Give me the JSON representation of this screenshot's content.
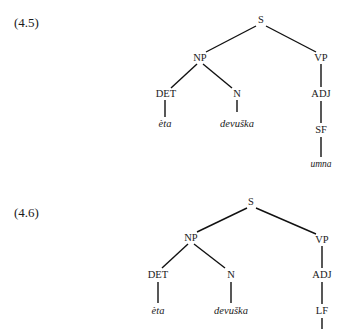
{
  "examples": [
    {
      "number": "(4.5)",
      "nodes": {
        "S": "S",
        "NP": "NP",
        "VP": "VP",
        "DET": "DET",
        "N": "N",
        "ADJ": "ADJ",
        "form": "SF"
      },
      "leaves": {
        "det": "èta",
        "noun": "devuška",
        "adj": "umna"
      }
    },
    {
      "number": "(4.6)",
      "nodes": {
        "S": "S",
        "NP": "NP",
        "VP": "VP",
        "DET": "DET",
        "N": "N",
        "ADJ": "ADJ",
        "form": "LF"
      },
      "leaves": {
        "det": "èta",
        "noun": "devuška"
      }
    }
  ]
}
